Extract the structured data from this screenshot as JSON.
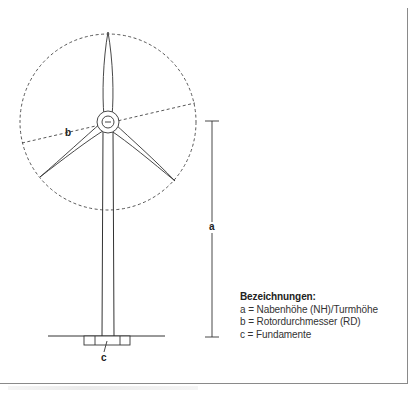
{
  "diagram": {
    "labels": {
      "a": "a",
      "b": "b",
      "c": "c"
    },
    "legend": {
      "title": "Bezeichnungen:",
      "items": [
        "a = Nabenhöhe (NH)/Turmhöhe",
        "b = Rotordurchmesser (RD)",
        "c = Fundamente"
      ]
    },
    "colors": {
      "line": "#333333",
      "frame": "#8a8a8a"
    }
  }
}
